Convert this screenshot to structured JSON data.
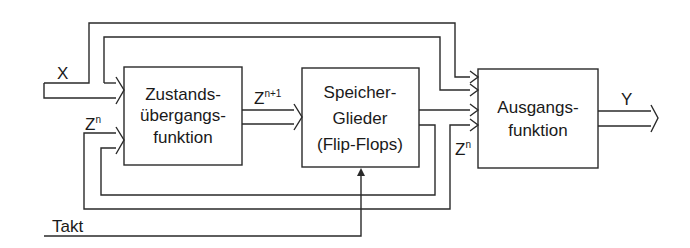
{
  "diagram": {
    "type": "block-diagram",
    "title": "",
    "blocks": [
      {
        "id": "zustand",
        "lines": [
          "Zustands-",
          "übergangs-",
          "funktion"
        ]
      },
      {
        "id": "speicher",
        "lines": [
          "Speicher-",
          "Glieder",
          "(Flip-Flops)"
        ]
      },
      {
        "id": "ausgang",
        "lines": [
          "Ausgangs-",
          "funktion"
        ]
      }
    ],
    "signals": {
      "x": "X",
      "zn_in": {
        "base": "Z",
        "sup": "n"
      },
      "zn1": {
        "base": "Z",
        "sup": "n+1"
      },
      "zn_out": {
        "base": "Z",
        "sup": "n"
      },
      "y": "Y",
      "takt": "Takt"
    },
    "colors": {
      "stroke": "#2a2a2a",
      "background": "#ffffff"
    }
  }
}
